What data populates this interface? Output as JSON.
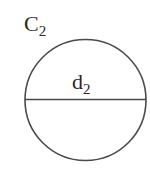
{
  "diagram": {
    "type": "circle-with-diameter",
    "circle": {
      "name": "C",
      "subscript": "2",
      "center": [
        85.5,
        100
      ],
      "radius": 60,
      "stroke_color": "#4a4a4a"
    },
    "diameter": {
      "name": "d",
      "subscript": "2",
      "orientation": "horizontal",
      "stroke_color": "#4a4a4a"
    }
  }
}
